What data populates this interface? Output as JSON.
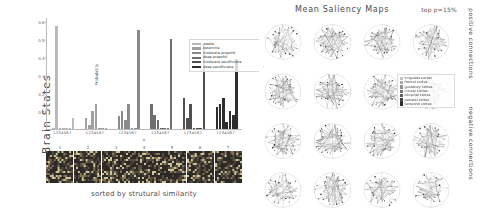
{
  "left": {
    "side_label": "Brain States",
    "caption": "sorted by strutural similarity",
    "axis": {
      "ylabel": "Probability",
      "xlabel": "x",
      "yticks": [
        "0.1",
        "0.2",
        "0.3",
        "0.4",
        "0.5",
        "0.6"
      ],
      "group_ticklabels": [
        "1234567",
        "1234567",
        "1234567",
        "1234567",
        "1234567",
        "1234567"
      ]
    },
    "legend": [
      {
        "label": "awake",
        "color": "#b9b9b9"
      },
      {
        "label": "ketamine",
        "color": "#a0a0a0"
      },
      {
        "label": "moderate propofol",
        "color": "#8a8a8a"
      },
      {
        "label": "deep propofol",
        "color": "#6e6e6e"
      },
      {
        "label": "moderate sevoflurane",
        "color": "#505050"
      },
      {
        "label": "deep sevoflurane",
        "color": "#2e2e2e"
      }
    ],
    "heatstrip_numbers": [
      "1",
      "2",
      "3",
      "4",
      "5",
      "6",
      "7"
    ]
  },
  "right": {
    "title": "Mean Saliency Maps",
    "top_p": "top p=15%",
    "positive_label": "positive connections",
    "negative_label": "negative connections",
    "region_legend": [
      {
        "label": "cingulate cortex",
        "color": "#c3c3c3"
      },
      {
        "label": "frontal cortex",
        "color": "#a8a8a8"
      },
      {
        "label": "gustatory cortex",
        "color": "#8f8f8f"
      },
      {
        "label": "insular cortex",
        "color": "#767676"
      },
      {
        "label": "occipital cortex",
        "color": "#5c5c5c"
      },
      {
        "label": "parietal cortex",
        "color": "#434343"
      },
      {
        "label": "temporal cortex",
        "color": "#2a2a2a"
      }
    ]
  },
  "chart_data": {
    "type": "bar",
    "title": "",
    "xlabel": "x",
    "ylabel": "Probability",
    "ylim": [
      0,
      0.62
    ],
    "grid": false,
    "legend_position": "upper-right-inside",
    "categories": [
      "1",
      "2",
      "3",
      "4",
      "5",
      "6",
      "7"
    ],
    "series": [
      {
        "name": "awake",
        "color": "#b9b9b9",
        "values": [
          0.005,
          0.57,
          0.004,
          0.003,
          0.004,
          0.004,
          0.06
        ]
      },
      {
        "name": "ketamine",
        "color": "#a0a0a0",
        "values": [
          0.06,
          0.02,
          0.1,
          0.14,
          0.005,
          0.004,
          0.005
        ]
      },
      {
        "name": "moderate propofol",
        "color": "#8a8a8a",
        "values": [
          0.07,
          0.1,
          0.05,
          0.14,
          0.005,
          0.004,
          0.55
        ]
      },
      {
        "name": "deep propofol",
        "color": "#6e6e6e",
        "values": [
          0.14,
          0.08,
          0.05,
          0.004,
          0.004,
          0.003,
          0.5
        ]
      },
      {
        "name": "moderate sevoflurane",
        "color": "#505050",
        "values": [
          0.17,
          0.06,
          0.14,
          0.005,
          0.004,
          0.004,
          0.46
        ]
      },
      {
        "name": "deep sevoflurane",
        "color": "#2e2e2e",
        "values": [
          0.12,
          0.14,
          0.17,
          0.04,
          0.1,
          0.08,
          0.39
        ]
      }
    ]
  }
}
